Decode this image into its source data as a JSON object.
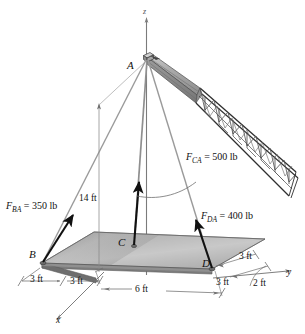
{
  "figure": {
    "type": "engineering-free-body-diagram",
    "width": 305,
    "height": 334,
    "background_color": "#ffffff"
  },
  "axes": [
    {
      "name": "z-axis",
      "label": "z",
      "direction": "vertical-up"
    },
    {
      "name": "y-axis",
      "label": "y",
      "direction": "right"
    },
    {
      "name": "x-axis",
      "label": "x",
      "direction": "lower-left"
    }
  ],
  "points": [
    {
      "name": "apex",
      "label": "A",
      "role": "crane boom tip / cable junction"
    },
    {
      "name": "corner-b",
      "label": "B",
      "role": "plate corner, cable anchor"
    },
    {
      "name": "corner-c",
      "label": "C",
      "role": "plate point, cable anchor"
    },
    {
      "name": "corner-d",
      "label": "D",
      "role": "plate corner, cable anchor"
    }
  ],
  "forces": [
    {
      "name": "force-ba",
      "symbol": "F",
      "subscript": "BA",
      "equals": "=",
      "value": "350 lb",
      "full_text": "F_BA = 350 lb",
      "magnitude": 350,
      "unit": "lb",
      "from": "B",
      "to": "A"
    },
    {
      "name": "force-ca",
      "symbol": "F",
      "subscript": "CA",
      "equals": "=",
      "value": "500 lb",
      "full_text": "F_CA = 500 lb",
      "magnitude": 500,
      "unit": "lb",
      "from": "C",
      "to": "A"
    },
    {
      "name": "force-da",
      "symbol": "F",
      "subscript": "DA",
      "equals": "=",
      "value": "400 lb",
      "full_text": "F_DA = 400 lb",
      "magnitude": 400,
      "unit": "lb",
      "from": "D",
      "to": "A"
    }
  ],
  "dimensions": [
    {
      "name": "height-dim",
      "label": "14 ft",
      "value": 14,
      "unit": "ft",
      "orientation": "vertical",
      "describes": "height of A above plate"
    },
    {
      "name": "dim-left-outer",
      "label": "3 ft",
      "value": 3,
      "unit": "ft",
      "orientation": "x-direction"
    },
    {
      "name": "dim-left-inner",
      "label": "3 ft",
      "value": 3,
      "unit": "ft",
      "orientation": "x-direction"
    },
    {
      "name": "dim-front",
      "label": "6 ft",
      "value": 6,
      "unit": "ft",
      "orientation": "y-direction"
    },
    {
      "name": "dim-right-upper",
      "label": "3 ft",
      "value": 3,
      "unit": "ft",
      "orientation": "x-direction"
    },
    {
      "name": "dim-right-lower",
      "label": "3 ft",
      "value": 3,
      "unit": "ft",
      "orientation": "x-direction"
    },
    {
      "name": "dim-right-end",
      "label": "2 ft",
      "value": 2,
      "unit": "ft",
      "orientation": "y-direction"
    }
  ],
  "objects": [
    {
      "name": "plate",
      "description": "rectangular gray plate lifted by three cables"
    },
    {
      "name": "crane-boom",
      "description": "lattice truss crane boom extending to upper right from A"
    },
    {
      "name": "cable-ab",
      "description": "cable from A to B"
    },
    {
      "name": "cable-ac",
      "description": "cable from A to C"
    },
    {
      "name": "cable-ad",
      "description": "cable from A to D"
    }
  ],
  "colors": {
    "plate_light": "#bdbdbd",
    "plate_mid": "#a3a3a3",
    "plate_dark": "#8a8a8a",
    "plate_edge": "#6e6e6e",
    "cable": "#9a9a9a",
    "arrow": "#111111",
    "boom_fill": "#a8a8a8",
    "line": "#4a4a4a"
  }
}
